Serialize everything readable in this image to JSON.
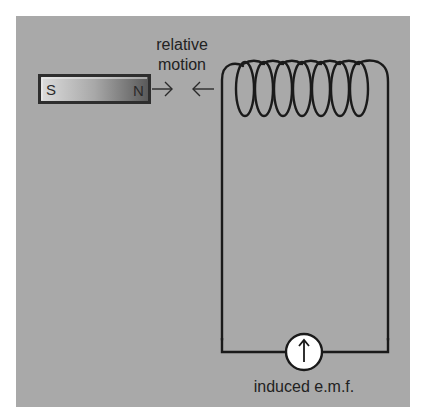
{
  "diagram": {
    "magnet": {
      "south_label": "S",
      "north_label": "N"
    },
    "motion_label_line1": "relative",
    "motion_label_line2": "motion",
    "arrows": [
      "right-arrow",
      "left-arrow"
    ],
    "coil": {
      "loops": 7
    },
    "meter": {
      "icon": "galvanometer-icon",
      "needle": "up"
    },
    "emf_label": "induced e.m.f.",
    "colors": {
      "background": "#a9a9a9",
      "wire": "#1a1a1a",
      "meter_face": "#ffffff",
      "magnet_dark": "#3a3a3a",
      "magnet_light": "#d6d6d6"
    }
  }
}
